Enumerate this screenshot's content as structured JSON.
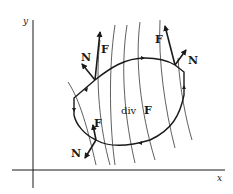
{
  "diagram": {
    "axes": {
      "x_label": "x",
      "y_label": "y"
    },
    "region_label": {
      "prefix": "div",
      "vector": "F"
    },
    "vectors": [
      {
        "field": "F",
        "normal": "N",
        "position": "upper-left"
      },
      {
        "field": "F",
        "normal": "N",
        "position": "upper-right"
      },
      {
        "field": "F",
        "normal": "N",
        "position": "lower-left"
      }
    ],
    "colors": {
      "ink": "#1a1a1a",
      "background": "#ffffff"
    }
  }
}
